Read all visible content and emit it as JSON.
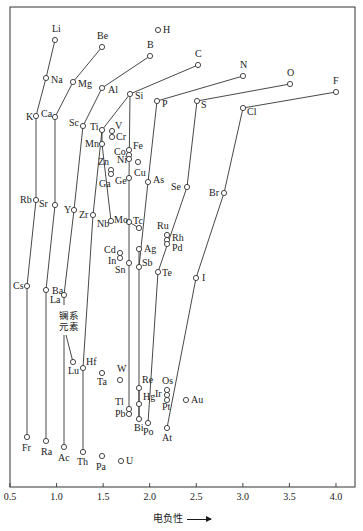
{
  "chart_data": {
    "type": "scatter",
    "title": "",
    "xlabel": "电负性",
    "ylabel": "",
    "xlim": [
      0.5,
      4.2
    ],
    "grid": false,
    "x_ticks": [
      "0.5",
      "1.0",
      "1.5",
      "2.0",
      "2.5",
      "3.0",
      "3.5",
      "4.0"
    ],
    "annotation": "镧系元素",
    "points": [
      {
        "el": "H",
        "x": 2.1,
        "px": 158,
        "py": 30,
        "lx": 5,
        "ly": 3
      },
      {
        "el": "Li",
        "x": 1.0,
        "px": 55,
        "py": 40,
        "lx": -3,
        "ly": -8
      },
      {
        "el": "Be",
        "x": 1.5,
        "px": 102,
        "py": 47,
        "lx": -5,
        "ly": -8
      },
      {
        "el": "B",
        "x": 2.0,
        "px": 150,
        "py": 56,
        "lx": -3,
        "ly": -8
      },
      {
        "el": "C",
        "x": 2.5,
        "px": 198,
        "py": 65,
        "lx": -3,
        "ly": -8
      },
      {
        "el": "N",
        "x": 3.0,
        "px": 243,
        "py": 76,
        "lx": -3,
        "ly": -8
      },
      {
        "el": "O",
        "x": 3.5,
        "px": 290,
        "py": 84,
        "lx": -3,
        "ly": -8
      },
      {
        "el": "F",
        "x": 4.0,
        "px": 336,
        "py": 92,
        "lx": -3,
        "ly": -8
      },
      {
        "el": "Na",
        "x": 0.9,
        "px": 46,
        "py": 78,
        "lx": 5,
        "ly": 5
      },
      {
        "el": "Mg",
        "x": 1.2,
        "px": 73,
        "py": 82,
        "lx": 5,
        "ly": 5
      },
      {
        "el": "Al",
        "x": 1.5,
        "px": 102,
        "py": 88,
        "lx": 6,
        "ly": 5
      },
      {
        "el": "Si",
        "x": 1.8,
        "px": 130,
        "py": 94,
        "lx": 5,
        "ly": 5
      },
      {
        "el": "P",
        "x": 2.1,
        "px": 157,
        "py": 101,
        "lx": 5,
        "ly": 6
      },
      {
        "el": "S",
        "x": 2.5,
        "px": 197,
        "py": 101,
        "lx": 4,
        "ly": 7
      },
      {
        "el": "Cl",
        "x": 3.0,
        "px": 243,
        "py": 108,
        "lx": 4,
        "ly": 7
      },
      {
        "el": "K",
        "x": 0.8,
        "px": 36,
        "py": 116,
        "lx": -10,
        "ly": 4
      },
      {
        "el": "Ca",
        "x": 1.0,
        "px": 55,
        "py": 117,
        "lx": -14,
        "ly": 0
      },
      {
        "el": "Sc",
        "x": 1.3,
        "px": 83,
        "py": 126,
        "lx": -14,
        "ly": 0
      },
      {
        "el": "Ti",
        "x": 1.5,
        "px": 102,
        "py": 130,
        "lx": -12,
        "ly": 0
      },
      {
        "el": "V",
        "x": 1.6,
        "px": 112,
        "py": 131,
        "lx": 3,
        "ly": -2
      },
      {
        "el": "Cr",
        "x": 1.6,
        "px": 112,
        "py": 137,
        "lx": 4,
        "ly": 3
      },
      {
        "el": "Mn",
        "x": 1.5,
        "px": 102,
        "py": 144,
        "lx": -17,
        "ly": 3
      },
      {
        "el": "Fe",
        "x": 1.8,
        "px": 129,
        "py": 150,
        "lx": 4,
        "ly": -1
      },
      {
        "el": "Co",
        "x": 1.8,
        "px": 129,
        "py": 155,
        "lx": -15,
        "ly": 0
      },
      {
        "el": "Ni",
        "x": 1.8,
        "px": 129,
        "py": 159,
        "lx": -12,
        "ly": 4
      },
      {
        "el": "Cu",
        "x": 1.9,
        "px": 138,
        "py": 162,
        "lx": -4,
        "ly": 14
      },
      {
        "el": "Zn",
        "x": 1.6,
        "px": 111,
        "py": 170,
        "lx": -13,
        "ly": -5
      },
      {
        "el": "Ga",
        "x": 1.6,
        "px": 111,
        "py": 174,
        "lx": -12,
        "ly": 13
      },
      {
        "el": "Ge",
        "x": 1.8,
        "px": 129,
        "py": 178,
        "lx": -14,
        "ly": 6
      },
      {
        "el": "As",
        "x": 2.0,
        "px": 148,
        "py": 182,
        "lx": 5,
        "ly": 1
      },
      {
        "el": "Se",
        "x": 2.4,
        "px": 187,
        "py": 187,
        "lx": -16,
        "ly": 3
      },
      {
        "el": "Br",
        "x": 2.8,
        "px": 224,
        "py": 193,
        "lx": -15,
        "ly": 3
      },
      {
        "el": "Rb",
        "x": 0.8,
        "px": 36,
        "py": 200,
        "lx": -16,
        "ly": 3
      },
      {
        "el": "Sr",
        "x": 1.0,
        "px": 55,
        "py": 205,
        "lx": -16,
        "ly": 2
      },
      {
        "el": "Y",
        "x": 1.2,
        "px": 74,
        "py": 210,
        "lx": -10,
        "ly": 3
      },
      {
        "el": "Zr",
        "x": 1.4,
        "px": 93,
        "py": 215,
        "lx": -14,
        "ly": 3
      },
      {
        "el": "Nb",
        "x": 1.6,
        "px": 111,
        "py": 221,
        "lx": -14,
        "ly": 6
      },
      {
        "el": "Mo",
        "x": 1.8,
        "px": 129,
        "py": 222,
        "lx": -15,
        "ly": 1
      },
      {
        "el": "Tc",
        "x": 1.9,
        "px": 139,
        "py": 228,
        "lx": -6,
        "ly": -4
      },
      {
        "el": "Ru",
        "x": 2.2,
        "px": 167,
        "py": 235,
        "lx": -10,
        "ly": -6
      },
      {
        "el": "Rh",
        "x": 2.2,
        "px": 167,
        "py": 240,
        "lx": 5,
        "ly": 1
      },
      {
        "el": "Pd",
        "x": 2.2,
        "px": 167,
        "py": 244,
        "lx": 5,
        "ly": 7
      },
      {
        "el": "Ag",
        "x": 1.9,
        "px": 139,
        "py": 249,
        "lx": 5,
        "ly": 3
      },
      {
        "el": "Cd",
        "x": 1.7,
        "px": 120,
        "py": 253,
        "lx": -16,
        "ly": 0
      },
      {
        "el": "In",
        "x": 1.7,
        "px": 120,
        "py": 258,
        "lx": -12,
        "ly": 6
      },
      {
        "el": "Sn",
        "x": 1.8,
        "px": 129,
        "py": 263,
        "lx": -14,
        "ly": 10
      },
      {
        "el": "Sb",
        "x": 1.9,
        "px": 139,
        "py": 267,
        "lx": 3,
        "ly": -1
      },
      {
        "el": "Te",
        "x": 2.1,
        "px": 158,
        "py": 272,
        "lx": 4,
        "ly": 4
      },
      {
        "el": "I",
        "x": 2.5,
        "px": 196,
        "py": 278,
        "lx": 6,
        "ly": 3
      },
      {
        "el": "Cs",
        "x": 0.7,
        "px": 27,
        "py": 286,
        "lx": -14,
        "ly": 3
      },
      {
        "el": "Ba",
        "x": 0.9,
        "px": 46,
        "py": 290,
        "lx": 6,
        "ly": 4
      },
      {
        "el": "La",
        "x": 1.1,
        "px": 64,
        "py": 295,
        "lx": -14,
        "ly": 8
      },
      {
        "el": "Lu",
        "x": 1.2,
        "px": 73,
        "py": 362,
        "lx": -5,
        "ly": 12
      },
      {
        "el": "Hf",
        "x": 1.3,
        "px": 83,
        "py": 368,
        "lx": 3,
        "ly": -3
      },
      {
        "el": "Ta",
        "x": 1.5,
        "px": 102,
        "py": 373,
        "lx": -5,
        "ly": 12
      },
      {
        "el": "W",
        "x": 1.7,
        "px": 120,
        "py": 380,
        "lx": -3,
        "ly": -8
      },
      {
        "el": "Re",
        "x": 1.9,
        "px": 139,
        "py": 388,
        "lx": 3,
        "ly": -5
      },
      {
        "el": "Os",
        "x": 2.2,
        "px": 167,
        "py": 390,
        "lx": -5,
        "ly": -6
      },
      {
        "el": "Ir",
        "x": 2.2,
        "px": 167,
        "py": 395,
        "lx": -12,
        "ly": 2
      },
      {
        "el": "Pt",
        "x": 2.2,
        "px": 167,
        "py": 400,
        "lx": -5,
        "ly": 10
      },
      {
        "el": "Au",
        "x": 2.4,
        "px": 186,
        "py": 400,
        "lx": 5,
        "ly": 3
      },
      {
        "el": "Hg",
        "x": 1.9,
        "px": 139,
        "py": 404,
        "lx": 4,
        "ly": -4
      },
      {
        "el": "Tl",
        "x": 1.8,
        "px": 129,
        "py": 409,
        "lx": -14,
        "ly": -4
      },
      {
        "el": "Pb",
        "x": 1.8,
        "px": 129,
        "py": 414,
        "lx": -14,
        "ly": 3
      },
      {
        "el": "Bi",
        "x": 1.9,
        "px": 139,
        "py": 419,
        "lx": -5,
        "ly": 12
      },
      {
        "el": "Po",
        "x": 2.0,
        "px": 148,
        "py": 423,
        "lx": -5,
        "ly": 12
      },
      {
        "el": "At",
        "x": 2.2,
        "px": 167,
        "py": 428,
        "lx": -5,
        "ly": 13
      },
      {
        "el": "Fr",
        "x": 0.7,
        "px": 27,
        "py": 437,
        "lx": -5,
        "ly": 14
      },
      {
        "el": "Ra",
        "x": 0.9,
        "px": 46,
        "py": 441,
        "lx": -5,
        "ly": 14
      },
      {
        "el": "Ac",
        "x": 1.1,
        "px": 64,
        "py": 447,
        "lx": -6,
        "ly": 14
      },
      {
        "el": "Th",
        "x": 1.3,
        "px": 83,
        "py": 452,
        "lx": -6,
        "ly": 13
      },
      {
        "el": "Pa",
        "x": 1.5,
        "px": 102,
        "py": 456,
        "lx": -6,
        "ly": 14
      },
      {
        "el": "U",
        "x": 1.7,
        "px": 121,
        "py": 461,
        "lx": 5,
        "ly": 3
      }
    ],
    "lines": [
      [
        "Li",
        "Na",
        "K",
        "Rb",
        "Cs",
        "Fr"
      ],
      [
        "Be",
        "Mg",
        "Ca",
        "Sr",
        "Ba",
        "Ra"
      ],
      [
        "B",
        "Al",
        "Sc",
        "Y",
        "La"
      ],
      [
        "C",
        "Si",
        "Ti",
        "Zr",
        "Hf",
        "Th"
      ],
      [
        "N",
        "P",
        "As",
        "Sb",
        "Bi"
      ],
      [
        "O",
        "S",
        "Se",
        "Te",
        "Po"
      ],
      [
        "F",
        "Cl",
        "Br",
        "I",
        "At"
      ],
      [
        "Si",
        "Ge",
        "Sn",
        "Pb"
      ],
      [
        "Ti",
        "Mn"
      ],
      [
        "Mn",
        "Nb"
      ],
      [
        "Mo",
        "Tc"
      ],
      [
        "Ag",
        "Sb"
      ],
      [
        "Re",
        "Hg"
      ],
      [
        "Hg",
        "Bi"
      ]
    ]
  }
}
